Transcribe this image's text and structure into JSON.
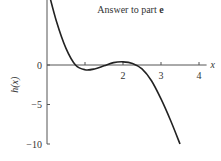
{
  "chart_data": {
    "type": "line",
    "title": "Answer to part e",
    "title_prefix": "Answer to part ",
    "title_bold": "e",
    "xlabel": "x",
    "ylabel": "h(x)",
    "xlim": [
      0,
      4
    ],
    "ylim": [
      -10,
      10
    ],
    "xticks": [
      1,
      2,
      3,
      4
    ],
    "xtick_labels": [
      "",
      "2",
      "3",
      "4"
    ],
    "yticks": [
      10,
      0,
      -5,
      -10
    ],
    "ytick_labels": [
      "10",
      "0",
      "−5",
      "−10"
    ],
    "grid": false,
    "series": [
      {
        "name": "h(x)",
        "x": [
          0,
          0.25,
          0.5,
          0.75,
          1.0,
          1.25,
          1.5,
          1.75,
          2.0,
          2.25,
          2.5,
          2.75,
          3.0,
          3.25,
          3.5
        ],
        "y": [
          10,
          5.5,
          2.1,
          0.0,
          -0.6,
          -0.5,
          -0.1,
          0.3,
          0.4,
          0.2,
          -0.5,
          -2.0,
          -4.3,
          -7.0,
          -10
        ]
      }
    ]
  }
}
